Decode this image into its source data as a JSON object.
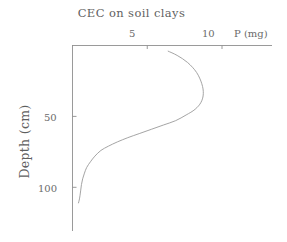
{
  "chart_data": {
    "type": "line",
    "title": "CEC on soil clays",
    "xlabel": "P (mg)",
    "ylabel": "Depth (cm)",
    "x_axis_position": "top",
    "y_axis_direction": "inverted",
    "xlim": [
      0,
      12.5
    ],
    "ylim": [
      0,
      130
    ],
    "xticks": [
      5,
      10
    ],
    "xtick_labels": [
      "5",
      "10"
    ],
    "yticks": [
      50,
      100
    ],
    "ytick_labels": [
      "50",
      "100"
    ],
    "grid": false,
    "legend": false,
    "series": [
      {
        "name": "P profile",
        "x": [
          6.4,
          7.0,
          7.7,
          8.3,
          8.65,
          8.75,
          8.6,
          8.2,
          7.6,
          6.9,
          6.1,
          5.3,
          4.5,
          3.7,
          3.0,
          2.4,
          1.9,
          1.5,
          1.2,
          0.95,
          0.8,
          0.68,
          0.6,
          0.55,
          0.5,
          0.45,
          0.4
        ],
        "y": [
          4,
          7,
          12,
          19,
          27,
          34,
          40,
          45,
          49,
          53,
          56,
          59,
          62,
          65,
          68,
          71,
          74,
          78,
          82,
          86,
          90,
          94,
          98,
          102,
          106,
          109,
          111
        ]
      }
    ],
    "line_color": "#9a9a9a",
    "axis_color": "#8f8f8f"
  },
  "axis_titles": {
    "x": "P (mg)",
    "y": "Depth (cm)"
  },
  "tick_text": {
    "x5": "5",
    "x10": "10",
    "y50": "50",
    "y100": "100"
  }
}
